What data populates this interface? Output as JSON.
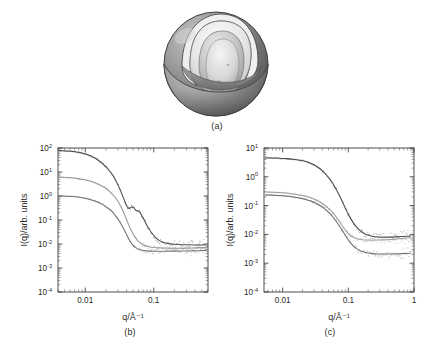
{
  "figure": {
    "panels": [
      {
        "id": "a",
        "caption": "(a)",
        "kind": "schematic",
        "description": "cut-away multilamellar vesicle"
      },
      {
        "id": "b",
        "caption": "(b)",
        "kind": "plot"
      },
      {
        "id": "c",
        "caption": "(c)",
        "kind": "plot"
      }
    ]
  },
  "schematic": {
    "name": "multilamellar-vesicle-cutaway",
    "colors": {
      "outer_shell": "#8d8d8d",
      "outer_shell_dark": "#585858",
      "outer_shell_light": "#b9b9b9",
      "inner_cavity": "#efefef",
      "inner_shell": "#c9c9c9",
      "core": "#dcdcdc",
      "outline": "#4a4a4a"
    }
  },
  "chart_data": [
    {
      "id": "b",
      "type": "line",
      "title": "",
      "xlabel": "q/Å⁻¹",
      "ylabel": "I(q)/arb. units",
      "xscale": "log",
      "yscale": "log",
      "xlim": [
        0.004,
        0.62
      ],
      "ylim": [
        0.0001,
        100
      ],
      "xticks": [
        0.01,
        0.1
      ],
      "xticklabels": [
        "0.01",
        "0.1"
      ],
      "yticks": [
        0.0001,
        0.001,
        0.01,
        0.1,
        1,
        10,
        100
      ],
      "yticklabels": [
        "10-4",
        "10-3",
        "10-2",
        "10-1",
        "100",
        "101",
        "102"
      ],
      "grid": false,
      "legend": "none",
      "series": [
        {
          "name": "upper curve",
          "color": "#4d4d4d",
          "x": [
            0.0042,
            0.005,
            0.006,
            0.0072,
            0.0086,
            0.0103,
            0.0124,
            0.0148,
            0.0178,
            0.0213,
            0.0255,
            0.03,
            0.034,
            0.0375,
            0.04,
            0.0425,
            0.045,
            0.048,
            0.051,
            0.0545,
            0.058,
            0.062,
            0.067,
            0.072,
            0.079,
            0.087,
            0.096,
            0.11,
            0.13,
            0.16,
            0.2,
            0.26,
            0.34,
            0.44,
            0.56
          ],
          "y": [
            78,
            76,
            73,
            69,
            63,
            55,
            45,
            34,
            23,
            14,
            7.2,
            3.0,
            1.3,
            0.62,
            0.4,
            0.3,
            0.31,
            0.36,
            0.34,
            0.24,
            0.245,
            0.22,
            0.155,
            0.105,
            0.062,
            0.038,
            0.026,
            0.0165,
            0.0122,
            0.0104,
            0.0097,
            0.0094,
            0.0092,
            0.0091,
            0.0091
          ]
        },
        {
          "name": "middle curve",
          "color": "#9a9a9a",
          "x": [
            0.0042,
            0.005,
            0.006,
            0.0072,
            0.0086,
            0.0103,
            0.0124,
            0.0148,
            0.0178,
            0.0213,
            0.0255,
            0.03,
            0.034,
            0.0375,
            0.041,
            0.045,
            0.05,
            0.056,
            0.063,
            0.07,
            0.08,
            0.092,
            0.11,
            0.135,
            0.17,
            0.22,
            0.29,
            0.38,
            0.48,
            0.58
          ],
          "y": [
            6.2,
            6.0,
            5.8,
            5.5,
            5.1,
            4.6,
            4.0,
            3.3,
            2.6,
            1.85,
            1.15,
            0.62,
            0.32,
            0.17,
            0.09,
            0.046,
            0.026,
            0.0155,
            0.011,
            0.0092,
            0.008,
            0.0074,
            0.007,
            0.0068,
            0.0067,
            0.0067,
            0.0067,
            0.0068,
            0.007,
            0.0071
          ]
        },
        {
          "name": "lower curve",
          "color": "#767676",
          "x": [
            0.0042,
            0.005,
            0.006,
            0.0072,
            0.0086,
            0.0103,
            0.0124,
            0.0148,
            0.0178,
            0.0213,
            0.0255,
            0.03,
            0.0345,
            0.039,
            0.043,
            0.047,
            0.052,
            0.058,
            0.065,
            0.073,
            0.083,
            0.095,
            0.11,
            0.135,
            0.17,
            0.22,
            0.29,
            0.38,
            0.48,
            0.58
          ],
          "y": [
            1.02,
            1.0,
            0.97,
            0.93,
            0.87,
            0.79,
            0.69,
            0.575,
            0.45,
            0.325,
            0.205,
            0.113,
            0.058,
            0.029,
            0.0168,
            0.0108,
            0.0077,
            0.0062,
            0.0056,
            0.0053,
            0.0051,
            0.005,
            0.005,
            0.005,
            0.005,
            0.0051,
            0.0051,
            0.0052,
            0.0053,
            0.0054
          ]
        }
      ]
    },
    {
      "id": "c",
      "type": "line",
      "title": "",
      "xlabel": "q/Å⁻¹",
      "ylabel": "I(q)/arb. units",
      "xscale": "log",
      "yscale": "log",
      "xlim": [
        0.0052,
        1.0
      ],
      "ylim": [
        0.0001,
        10
      ],
      "xticks": [
        0.01,
        0.1,
        1
      ],
      "xticklabels": [
        "0.01",
        "0.1",
        "1"
      ],
      "yticks": [
        0.0001,
        0.001,
        0.01,
        0.1,
        1,
        10
      ],
      "yticklabels": [
        "10-4",
        "10-3",
        "10-2",
        "10-1",
        "100",
        "101"
      ],
      "grid": false,
      "legend": "none",
      "series": [
        {
          "name": "upper curve",
          "color": "#4d4d4d",
          "x": [
            0.0055,
            0.0065,
            0.008,
            0.01,
            0.0125,
            0.0155,
            0.0195,
            0.0245,
            0.0305,
            0.038,
            0.047,
            0.058,
            0.07,
            0.084,
            0.1,
            0.12,
            0.145,
            0.175,
            0.21,
            0.255,
            0.31,
            0.38,
            0.47,
            0.58,
            0.72,
            0.88
          ],
          "y": [
            4.5,
            4.5,
            4.45,
            4.35,
            4.2,
            4.0,
            3.7,
            3.2,
            2.6,
            1.85,
            1.15,
            0.6,
            0.28,
            0.115,
            0.048,
            0.024,
            0.0145,
            0.0105,
            0.009,
            0.0083,
            0.008,
            0.008,
            0.0081,
            0.0083,
            0.0085,
            0.0087
          ]
        },
        {
          "name": "middle curve",
          "color": "#a2a2a2",
          "x": [
            0.0055,
            0.0065,
            0.008,
            0.01,
            0.0125,
            0.0155,
            0.0195,
            0.0245,
            0.0305,
            0.038,
            0.047,
            0.058,
            0.07,
            0.084,
            0.1,
            0.12,
            0.145,
            0.175,
            0.21,
            0.255,
            0.31,
            0.38,
            0.47,
            0.58,
            0.72,
            0.88
          ],
          "y": [
            0.3,
            0.295,
            0.29,
            0.28,
            0.265,
            0.25,
            0.228,
            0.2,
            0.168,
            0.13,
            0.092,
            0.058,
            0.033,
            0.0175,
            0.0105,
            0.0077,
            0.0067,
            0.0064,
            0.0063,
            0.0063,
            0.0064,
            0.0065,
            0.0067,
            0.007,
            0.0073,
            0.0076
          ]
        },
        {
          "name": "lower curve",
          "color": "#6f6f6f",
          "x": [
            0.0055,
            0.0065,
            0.008,
            0.01,
            0.0125,
            0.0155,
            0.0195,
            0.0245,
            0.0305,
            0.038,
            0.047,
            0.058,
            0.07,
            0.084,
            0.1,
            0.12,
            0.145,
            0.175,
            0.21,
            0.255,
            0.31,
            0.38,
            0.47,
            0.58,
            0.72,
            0.88
          ],
          "y": [
            0.235,
            0.232,
            0.228,
            0.22,
            0.21,
            0.196,
            0.178,
            0.155,
            0.128,
            0.098,
            0.068,
            0.042,
            0.023,
            0.012,
            0.0062,
            0.0038,
            0.0028,
            0.0024,
            0.0022,
            0.0021,
            0.0021,
            0.0021,
            0.0021,
            0.0021,
            0.0022,
            0.0022
          ]
        }
      ]
    }
  ]
}
